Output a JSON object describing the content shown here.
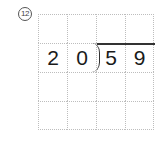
{
  "problem": {
    "number_label": "12",
    "type": "long-division",
    "divisor": "20",
    "dividend": "59"
  },
  "grid": {
    "rows": 4,
    "cols": 4,
    "cells": [
      [
        "",
        "",
        "",
        ""
      ],
      [
        "2",
        "0",
        "5",
        "9"
      ],
      [
        "",
        "",
        "",
        ""
      ],
      [
        "",
        "",
        "",
        ""
      ]
    ]
  },
  "colors": {
    "grid_line": "#bdbdbd",
    "text": "#1a1a1a",
    "division_bar": "#333333"
  }
}
